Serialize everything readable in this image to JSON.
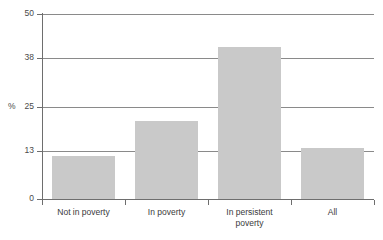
{
  "chart_data": {
    "type": "bar",
    "title": "",
    "subtitle": "",
    "xlabel": "",
    "ylabel": "%",
    "ylim": [
      0,
      50
    ],
    "yticks": [
      0,
      13,
      25,
      38,
      50
    ],
    "ytick_labels": [
      "0",
      "13",
      "25",
      "38",
      "50"
    ],
    "grid": true,
    "legend": false,
    "categories": [
      "Not in poverty",
      "In poverty",
      "In persistent poverty",
      "All"
    ],
    "category_lines": [
      [
        "Not in poverty"
      ],
      [
        "In poverty"
      ],
      [
        "In persistent",
        "poverty"
      ],
      [
        "All"
      ]
    ],
    "values": [
      11.6,
      21.0,
      41.0,
      13.9
    ],
    "series": [
      {
        "name": "%",
        "values": [
          11.6,
          21.0,
          41.0,
          13.9
        ]
      }
    ],
    "bar_color": "#c9c9c9",
    "axis_color": "#6e6e6e",
    "gridline_color": "#8a8a8a",
    "text_color": "#3a3a3a"
  }
}
